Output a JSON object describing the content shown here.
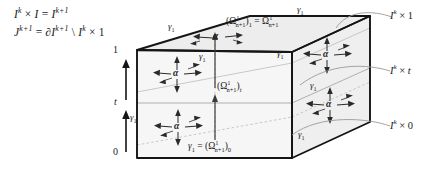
{
  "figure": {
    "formulas": [
      {
        "id": "formula-1",
        "text": "I k × I = I k+1"
      },
      {
        "id": "formula-2",
        "text": "J k+1 = ∂I k+1 \\ I k × 1"
      }
    ],
    "axis": {
      "name": "t-axis",
      "ticks": [
        {
          "label": "1",
          "x": 118,
          "y": 51
        },
        {
          "label": "t",
          "x": 119,
          "y": 102
        },
        {
          "label": "0",
          "x": 118,
          "y": 152
        }
      ],
      "arrows": 2
    },
    "gamma_labels": [
      {
        "id": "gamma-top-left",
        "text": "γ1",
        "x": 175,
        "y": 27
      },
      {
        "id": "gamma-top-right",
        "text": "γ1",
        "x": 303,
        "y": 11
      },
      {
        "id": "gamma-front-upper",
        "text": "γ1",
        "x": 205,
        "y": 57
      },
      {
        "id": "gamma-front-lower",
        "text": "γ1",
        "x": 135,
        "y": 118
      },
      {
        "id": "gamma-right-upper",
        "text": "γ1",
        "x": 282,
        "y": 54
      },
      {
        "id": "gamma-right-mid",
        "text": "γ1",
        "x": 315,
        "y": 86
      },
      {
        "id": "gamma-right-lower",
        "text": "γ1",
        "x": 303,
        "y": 135
      }
    ],
    "omega_labels": [
      {
        "id": "omega-top",
        "text": "(Ω1 n+1)1 = Ω1 n+1",
        "x": 232,
        "y": 21
      },
      {
        "id": "omega-middle",
        "text": "(Ω1 n+1)t",
        "x": 222,
        "y": 86
      },
      {
        "id": "omega-bottom",
        "text": "γ1 = (Ω1 n+1)0",
        "x": 193,
        "y": 146
      }
    ],
    "alpha_clusters": [
      {
        "id": "alpha-top-face",
        "label": "α",
        "x": 217,
        "y": 38,
        "kind": "horizontal"
      },
      {
        "id": "alpha-front-upper",
        "label": "α",
        "x": 177,
        "y": 74,
        "kind": "cross"
      },
      {
        "id": "alpha-front-lower",
        "label": "α",
        "x": 178,
        "y": 127,
        "kind": "cross"
      },
      {
        "id": "alpha-right-upper",
        "label": "α",
        "x": 327,
        "y": 55,
        "kind": "cross"
      },
      {
        "id": "alpha-right-lower",
        "label": "α",
        "x": 330,
        "y": 105,
        "kind": "cross"
      }
    ],
    "side_labels": [
      {
        "id": "side-label-1",
        "text": "I k × 1",
        "x": 394,
        "y": 14
      },
      {
        "id": "side-label-t",
        "text": "I k × t",
        "x": 394,
        "y": 70
      },
      {
        "id": "side-label-0",
        "text": "I k × 0",
        "x": 394,
        "y": 125
      }
    ],
    "colors": {
      "stroke": "#1a1a1a",
      "face_fill": "#ebebeb",
      "face_fill_light": "#f4f4f4",
      "thin_line": "#9a9a9a",
      "dashed_line": "#b5b5b5",
      "leader_line": "#8a8a8a"
    }
  }
}
